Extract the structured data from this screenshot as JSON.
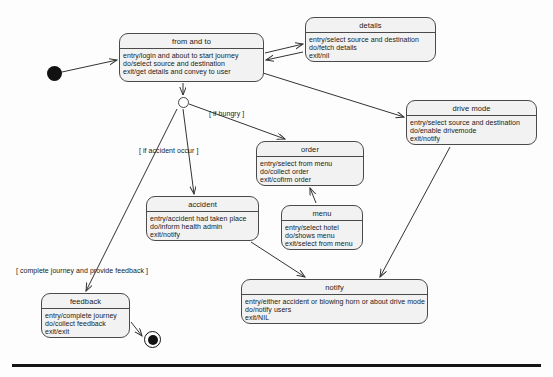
{
  "diagram": {
    "type": "uml-state-machine",
    "title": "",
    "background_color": "#fdfdfd",
    "node_fill": "#f2f2f2",
    "node_stroke": "#4a4a4a",
    "edge_color": "#333333"
  },
  "states": [
    {
      "id": "from-and-to",
      "name": "from and to",
      "lines": [
        "entry/login and about to start journey",
        "do/select source and destination",
        "exit/get details and convey to user"
      ],
      "x": 119,
      "y": 33,
      "w": 145,
      "h": 49
    },
    {
      "id": "details",
      "name": "details",
      "lines": [
        "entry/select source and destination",
        "do/fetch details",
        "exit/nil"
      ],
      "x": 305,
      "y": 17,
      "w": 131,
      "h": 45
    },
    {
      "id": "drive-mode",
      "name": "drive mode",
      "lines": [
        "entry/select source and destination",
        "do/enable drivemode",
        "exit/notify"
      ],
      "x": 406,
      "y": 100,
      "w": 131,
      "h": 45
    },
    {
      "id": "order",
      "name": "order",
      "lines": [
        "entry/select from menu",
        "do/collect order",
        "exit/cofirm order"
      ],
      "x": 256,
      "y": 141,
      "w": 108,
      "h": 45
    },
    {
      "id": "accident",
      "name": "accident",
      "lines": [
        "entry/accident had taken place",
        "do/inform health admin",
        "exit/notify"
      ],
      "x": 146,
      "y": 196,
      "w": 113,
      "h": 45
    },
    {
      "id": "menu",
      "name": "menu",
      "lines": [
        "entry/select hotel",
        "do/shows menu",
        "exit/select from menu"
      ],
      "x": 281,
      "y": 205,
      "w": 82,
      "h": 45
    },
    {
      "id": "notify",
      "name": "notify",
      "lines": [
        "entry/either accident or blowing horn or about drive mode",
        "do/notify users",
        "exit/NIL"
      ],
      "x": 241,
      "y": 279,
      "w": 187,
      "h": 45
    },
    {
      "id": "feedback",
      "name": "feedback",
      "lines": [
        "entry/complete journey",
        "do/collect feedback",
        "exit/exit"
      ],
      "x": 41,
      "y": 293,
      "w": 89,
      "h": 45
    }
  ],
  "pseudo_nodes": [
    {
      "id": "initial",
      "kind": "initial-state",
      "x": 47,
      "y": 66
    },
    {
      "id": "junction",
      "kind": "junction",
      "x": 178,
      "y": 97
    },
    {
      "id": "final",
      "kind": "final-state",
      "x": 144,
      "y": 331
    }
  ],
  "guards": [
    {
      "id": "guard-hungry",
      "text": "[ if hungry ]",
      "x": 209,
      "y": 110
    },
    {
      "id": "guard-accident",
      "text": "[ if accident occur ]",
      "x": 139,
      "y": 147
    },
    {
      "id": "guard-feedback",
      "text": "[ complete journey and provide feedback ]",
      "x": 16,
      "y": 267
    }
  ],
  "transitions": [
    {
      "from": "initial",
      "to": "from-and-to"
    },
    {
      "from": "from-and-to",
      "to": "details"
    },
    {
      "from": "details",
      "to": "from-and-to"
    },
    {
      "from": "from-and-to",
      "to": "junction"
    },
    {
      "from": "from-and-to",
      "to": "drive-mode"
    },
    {
      "from": "junction",
      "to": "order",
      "guard": "[ if hungry ]"
    },
    {
      "from": "junction",
      "to": "accident",
      "guard": "[ if accident occur ]"
    },
    {
      "from": "junction",
      "to": "feedback",
      "guard": "[ complete journey and provide feedback ]"
    },
    {
      "from": "order",
      "to": "menu"
    },
    {
      "from": "menu",
      "to": "order"
    },
    {
      "from": "accident",
      "to": "notify"
    },
    {
      "from": "drive-mode",
      "to": "notify"
    },
    {
      "from": "feedback",
      "to": "final"
    }
  ]
}
